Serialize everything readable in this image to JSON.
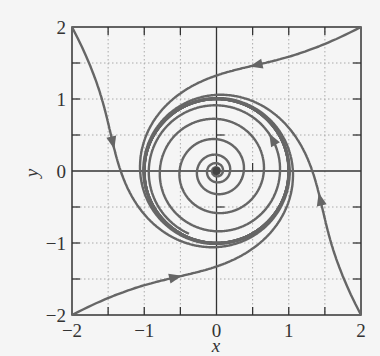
{
  "chart_data": {
    "type": "line",
    "title": "",
    "subtitle": "Phase portrait: unstable focus at origin spiraling out to a stable limit cycle of radius 1",
    "xlabel": "x",
    "ylabel": "y",
    "xlim": [
      -2,
      2
    ],
    "ylim": [
      -2,
      2
    ],
    "xticks": [
      -2,
      -1,
      0,
      1,
      2
    ],
    "yticks": [
      -2,
      -1,
      0,
      1,
      2
    ],
    "xtick_labels": [
      "−2",
      "−1",
      "0",
      "1",
      "2"
    ],
    "ytick_labels": [
      "−2",
      "−1",
      "0",
      "1",
      "2"
    ],
    "minor_ticks": [
      -1.5,
      -0.5,
      0.5,
      1.5
    ],
    "grid": true,
    "grid_style": "dotted",
    "legend": null,
    "colors": {
      "trajectory": "#666666",
      "axes": "#333333",
      "grid": "#aaaaaa",
      "background": "#f5f5f5"
    },
    "system": {
      "equilibrium": [
        0,
        0
      ],
      "equilibrium_type": "unstable spiral",
      "limit_cycle_radius": 1,
      "direction": "counterclockwise"
    },
    "series": [
      {
        "name": "trajectory from (2, 2)",
        "start": [
          2,
          2
        ],
        "end": "limit cycle r=1",
        "arrow_at": [
          0.45,
          1.85
        ]
      },
      {
        "name": "trajectory from (-2, 2)",
        "start": [
          -2,
          2
        ],
        "end": "limit cycle r=1",
        "arrow_at": [
          -1.78,
          0.3
        ]
      },
      {
        "name": "trajectory from (-2, -2)",
        "start": [
          -2,
          -2
        ],
        "end": "limit cycle r=1",
        "arrow_at": [
          -0.5,
          -1.72
        ]
      },
      {
        "name": "trajectory from (2, -2)",
        "start": [
          2,
          -2
        ],
        "end": "limit cycle r=1",
        "arrow_at": [
          1.78,
          -0.3
        ]
      },
      {
        "name": "trajectory from near origin",
        "start": [
          0.02,
          0
        ],
        "end": "limit cycle r=1",
        "arrow_at": [
          0.7,
          0.4
        ]
      }
    ]
  }
}
